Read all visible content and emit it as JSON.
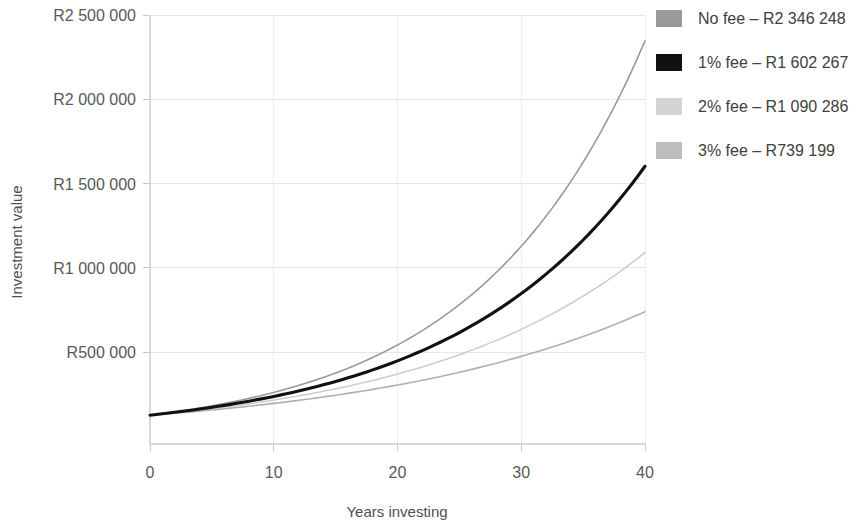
{
  "chart_data": {
    "type": "line",
    "title": "",
    "xlabel": "Years investing",
    "ylabel": "Investment value",
    "xlim": [
      0,
      40
    ],
    "ylim": [
      0,
      2500000
    ],
    "xticks": [
      0,
      10,
      20,
      30,
      40
    ],
    "xtick_labels": [
      "0",
      "10",
      "20",
      "30",
      "40"
    ],
    "yticks": [
      500000,
      1000000,
      1500000,
      2000000,
      2500000
    ],
    "ytick_labels": [
      "R500 000",
      "R1 000 000",
      "R1 500 000",
      "R2 000 000",
      "R2 500 000"
    ],
    "grid": true,
    "legend_position": "right",
    "x": [
      0,
      2,
      4,
      6,
      8,
      10,
      12,
      14,
      16,
      18,
      20,
      22,
      24,
      26,
      28,
      30,
      32,
      34,
      36,
      38,
      40
    ],
    "series": [
      {
        "name": "No fee",
        "legend_label": "No fee – R2 346 248",
        "final_value": 2346248,
        "color": "#9a9a9a",
        "width": 1.6,
        "values": [
          125000,
          148000,
          175000,
          207000,
          245000,
          290000,
          343000,
          406000,
          480000,
          568000,
          672000,
          795000,
          941000,
          1113000,
          1317000,
          1558000,
          1843000,
          2181000,
          2346248,
          2346248,
          2346248
        ]
      },
      {
        "name": "1% fee",
        "legend_label": "1% fee – R1 602 267",
        "final_value": 1602267,
        "color": "#111111",
        "width": 3.1,
        "values": [
          125000,
          145000,
          169000,
          196000,
          228000,
          265000,
          308000,
          357000,
          415000,
          482000,
          560000,
          650000,
          755000,
          877000,
          1019000,
          1183000,
          1374000,
          1596000,
          1602267,
          1602267,
          1602267
        ]
      },
      {
        "name": "2% fee",
        "legend_label": "2% fee – R1 090 286",
        "final_value": 1090286,
        "color": "#cccccc",
        "width": 1.5,
        "values": [
          125000,
          142000,
          162000,
          185000,
          211000,
          240000,
          274000,
          312000,
          356000,
          406000,
          463000,
          528000,
          602000,
          686000,
          782000,
          892000,
          1017000,
          1090286,
          1090286,
          1090286,
          1090286
        ]
      },
      {
        "name": "3% fee",
        "legend_label": "3% fee – R739 199",
        "final_value": 739199,
        "color": "#b0b0b0",
        "width": 1.6,
        "values": [
          125000,
          139000,
          155000,
          172000,
          192000,
          213000,
          238000,
          264000,
          294000,
          328000,
          365000,
          406000,
          452000,
          503000,
          560000,
          623000,
          694000,
          739199,
          739199,
          739199,
          739199
        ]
      }
    ]
  },
  "axis": {
    "y_title": "Investment value",
    "x_title": "Years investing",
    "ytick_0": "R500 000",
    "ytick_1": "R1 000 000",
    "ytick_2": "R1 500 000",
    "ytick_3": "R2 000 000",
    "ytick_4": "R2 500 000",
    "xtick_0": "0",
    "xtick_1": "10",
    "xtick_2": "20",
    "xtick_3": "30",
    "xtick_4": "40"
  },
  "legend": {
    "items": [
      {
        "label": "No fee – R2 346 248",
        "swatch": "#9a9a9a"
      },
      {
        "label": "1% fee – R1 602 267",
        "swatch": "#111111"
      },
      {
        "label": "2% fee – R1 090 286",
        "swatch": "#d4d4d4"
      },
      {
        "label": "3% fee – R739 199",
        "swatch": "#bdbdbd"
      }
    ]
  },
  "colors": {
    "background": "#ffffff",
    "grid": "#e6e6e6",
    "axis": "#d8d8d8",
    "text": "#4a4a4a"
  }
}
